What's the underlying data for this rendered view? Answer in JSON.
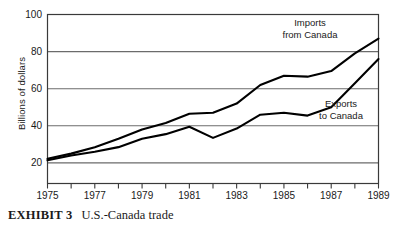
{
  "caption": {
    "lead": "EXHIBIT 3",
    "text": "U.S.-Canada trade"
  },
  "chart_data": {
    "type": "line",
    "title": "U.S.-Canada trade",
    "xlabel": "",
    "ylabel": "Billions of dollars",
    "xlim": [
      1975,
      1989
    ],
    "ylim": [
      0,
      100
    ],
    "yticks": [
      100,
      80,
      60,
      40,
      20
    ],
    "ytick_labels": [
      "100",
      "80",
      "60",
      "40",
      "20"
    ],
    "xticks": [
      1975,
      1976,
      1977,
      1978,
      1979,
      1980,
      1981,
      1982,
      1983,
      1984,
      1985,
      1986,
      1987,
      1988,
      1989
    ],
    "xtick_labels": [
      "1975",
      "1977",
      "1979",
      "1981",
      "1983",
      "1985",
      "1987",
      "1989"
    ],
    "xtick_labeled_years": [
      1975,
      1977,
      1979,
      1981,
      1983,
      1985,
      1987,
      1989
    ],
    "grid": "horizontal",
    "legend_position": "inline-annotations",
    "x": [
      1975,
      1976,
      1977,
      1978,
      1979,
      1980,
      1981,
      1982,
      1983,
      1984,
      1985,
      1986,
      1987,
      1988,
      1989
    ],
    "series": [
      {
        "name": "Imports from Canada",
        "label_line1": "Imports",
        "label_line2": "from Canada",
        "color": "#000000",
        "values": [
          22.2,
          25.0,
          28.5,
          33.0,
          38.0,
          41.5,
          46.5,
          47.0,
          52.0,
          62.0,
          67.0,
          66.5,
          69.5,
          79.0,
          87.0
        ]
      },
      {
        "name": "Exports to Canada",
        "label_line1": "Exports",
        "label_line2": "to Canada",
        "color": "#000000",
        "values": [
          21.4,
          24.0,
          26.0,
          28.5,
          33.0,
          35.5,
          39.5,
          33.5,
          38.5,
          46.0,
          47.0,
          45.5,
          50.0,
          63.0,
          76.0
        ]
      }
    ]
  },
  "annotations": {
    "imports_line1": "Imports",
    "imports_line2": "from Canada",
    "exports_line1": "Exports",
    "exports_line2": "to Canada"
  },
  "colors": {
    "axis": "#3a3a3a",
    "gridline": "#6b6b6b",
    "series": "#000000",
    "text": "#1a1a1a",
    "background": "#ffffff"
  }
}
